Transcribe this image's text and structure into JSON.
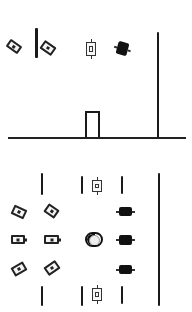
{
  "scene": {
    "style": "hand-drawn sketch",
    "background": "#ffffff",
    "ink": "#1a1a1a"
  },
  "top_panel": {
    "sprites": [
      {
        "id": "tilted-tag-left",
        "icon": "battery-tag-icon",
        "rotation": -35
      },
      {
        "id": "tilted-tag-right",
        "icon": "battery-tag-icon",
        "rotation": -35
      },
      {
        "id": "vertical-tag",
        "icon": "vertical-tag-icon",
        "rotation": 0
      },
      {
        "id": "solid-block",
        "icon": "solid-block-icon",
        "rotation": 15
      }
    ],
    "door": {
      "icon": "door-icon"
    },
    "ground": {
      "icon": "ground-line"
    },
    "pole": {
      "icon": "vertical-pole"
    }
  },
  "bottom_panel": {
    "tilted_tags_left": 4,
    "horizontal_tags": 2,
    "vertical_tags": 2,
    "solid_blocks": 3,
    "toggle": {
      "icon": "toggle-switch-icon",
      "state": "half"
    },
    "divider_lines": 6,
    "pole": {
      "icon": "vertical-pole"
    }
  }
}
